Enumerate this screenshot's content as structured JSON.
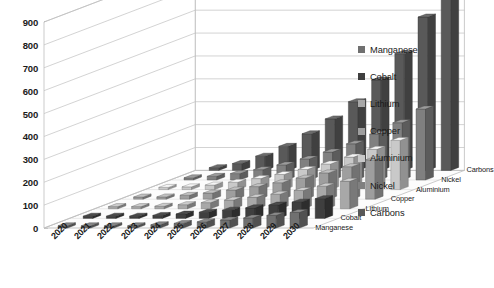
{
  "chart_data": {
    "type": "bar",
    "title": "",
    "subtitle": "",
    "xlabel": "",
    "ylabel": "",
    "zlabel": "",
    "render": "3d-column",
    "grid": true,
    "legend_position": "right",
    "ylim": [
      0,
      900
    ],
    "ytick_step": 100,
    "yticks": [
      "900",
      "800",
      "700",
      "600",
      "500",
      "400",
      "300",
      "200",
      "100",
      "0"
    ],
    "categories": [
      "2020",
      "2021",
      "2022",
      "2023",
      "2024",
      "2025",
      "2026",
      "2027",
      "2028",
      "2029",
      "2030"
    ],
    "depth_axis_labels": [
      "Carbons",
      "Nickel",
      "Aluminium",
      "Copper",
      "Lithium",
      "Cobalt",
      "Manganese"
    ],
    "series": [
      {
        "name": "Carbons",
        "color": "#595959",
        "values": [
          12,
          30,
          62,
          105,
          160,
          225,
          300,
          395,
          510,
          670,
          870
        ]
      },
      {
        "name": "Nickel",
        "color": "#808080",
        "values": [
          8,
          16,
          28,
          45,
          66,
          92,
          122,
          158,
          200,
          250,
          310
        ]
      },
      {
        "name": "Aluminium",
        "color": "#c9c9c9",
        "values": [
          6,
          12,
          20,
          32,
          48,
          66,
          88,
          112,
          142,
          176,
          215
        ]
      },
      {
        "name": "Copper",
        "color": "#9e9e9e",
        "values": [
          5,
          10,
          17,
          27,
          40,
          55,
          72,
          92,
          115,
          142,
          172
        ]
      },
      {
        "name": "Lithium",
        "color": "#a8a8a8",
        "values": [
          3,
          6,
          11,
          18,
          27,
          38,
          50,
          64,
          80,
          99,
          120
        ]
      },
      {
        "name": "Cobalt",
        "color": "#3f3f3f",
        "values": [
          2,
          4,
          8,
          13,
          19,
          27,
          36,
          46,
          58,
          71,
          86
        ]
      },
      {
        "name": "Manganese",
        "color": "#707070",
        "values": [
          1,
          3,
          5,
          9,
          14,
          20,
          27,
          35,
          44,
          55,
          68
        ]
      }
    ],
    "legend": [
      {
        "label": "Manganese",
        "color": "#707070"
      },
      {
        "label": "Cobalt",
        "color": "#3f3f3f"
      },
      {
        "label": "Lithium",
        "color": "#a8a8a8"
      },
      {
        "label": "Copper",
        "color": "#9e9e9e"
      },
      {
        "label": "Aluminium",
        "color": "#c9c9c9"
      },
      {
        "label": "Nickel",
        "color": "#808080"
      },
      {
        "label": "Carbons",
        "color": "#595959"
      }
    ]
  }
}
